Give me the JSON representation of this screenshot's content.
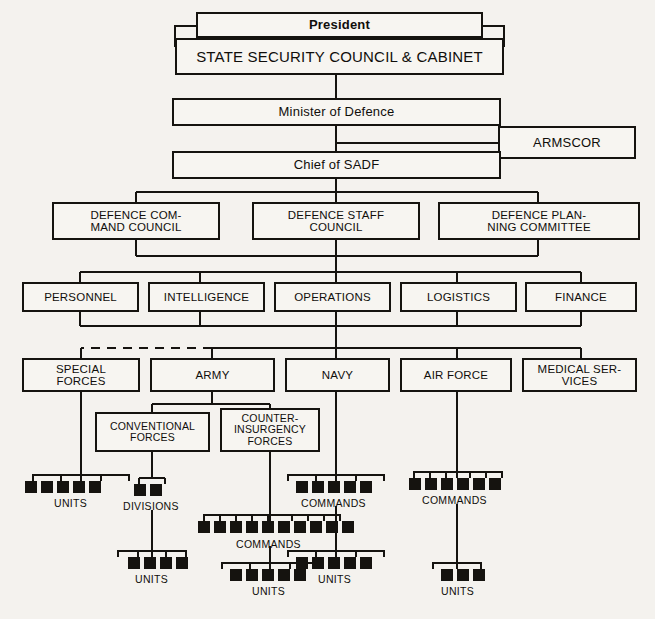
{
  "diagram": {
    "type": "org-chart",
    "line_color": "#15130f",
    "box_fill": "#f7f5f1",
    "background": "#f4f2ee"
  },
  "nodes": {
    "president": {
      "label": "President"
    },
    "state_security_council": {
      "label": "STATE SECURITY COUNCIL & CABINET"
    },
    "minister_of_defence": {
      "label": "Minister of Defence"
    },
    "armscor": {
      "label": "ARMSCOR"
    },
    "chief_of_sadf": {
      "label": "Chief of SADF"
    },
    "defence_command_council": {
      "label": "DEFENCE COM-\nMAND COUNCIL"
    },
    "defence_staff_council": {
      "label": "DEFENCE STAFF\nCOUNCIL"
    },
    "defence_planning_committee": {
      "label": "DEFENCE PLAN-\nNING COMMITTEE"
    },
    "personnel": {
      "label": "PERSONNEL"
    },
    "intelligence": {
      "label": "INTELLIGENCE"
    },
    "operations": {
      "label": "OPERATIONS"
    },
    "logistics": {
      "label": "LOGISTICS"
    },
    "finance": {
      "label": "FINANCE"
    },
    "special_forces": {
      "label": "SPECIAL\nFORCES"
    },
    "army": {
      "label": "ARMY"
    },
    "navy": {
      "label": "NAVY"
    },
    "air_force": {
      "label": "AIR FORCE"
    },
    "medical_services": {
      "label": "MEDICAL SER-\nVICES"
    },
    "conventional_forces": {
      "label": "CONVENTIONAL\nFORCES"
    },
    "counter_insurgency_forces": {
      "label": "COUNTER-\nINSURGENCY\nFORCES"
    }
  },
  "leaf_groups": {
    "sf_units": {
      "caption": "UNITS",
      "count": 5
    },
    "conv_divisions": {
      "caption": "DIVISIONS",
      "count": 2
    },
    "navy_commands": {
      "caption": "COMMANDS",
      "count": 5
    },
    "airforce_commands": {
      "caption": "COMMANDS",
      "count": 6
    },
    "coin_commands": {
      "caption": "COMMANDS",
      "count": 10
    },
    "divisions_units": {
      "caption": "UNITS",
      "count": 4
    },
    "coin_units": {
      "caption": "UNITS",
      "count": 5
    },
    "navy_units": {
      "caption": "UNITS",
      "count": 5
    },
    "airforce_units": {
      "caption": "UNITS",
      "count": 3
    }
  },
  "chart_data": {
    "type": "table",
    "levels": [
      {
        "level": 1,
        "nodes": [
          "President",
          "STATE SECURITY COUNCIL & CABINET"
        ]
      },
      {
        "level": 2,
        "nodes": [
          "Minister of Defence",
          "ARMSCOR"
        ]
      },
      {
        "level": 3,
        "nodes": [
          "Chief of SADF"
        ]
      },
      {
        "level": 4,
        "nodes": [
          "DEFENCE COMMAND COUNCIL",
          "DEFENCE STAFF COUNCIL",
          "DEFENCE PLANNING COMMITTEE"
        ]
      },
      {
        "level": 5,
        "nodes": [
          "PERSONNEL",
          "INTELLIGENCE",
          "OPERATIONS",
          "LOGISTICS",
          "FINANCE"
        ]
      },
      {
        "level": 6,
        "nodes": [
          "SPECIAL FORCES",
          "ARMY",
          "NAVY",
          "AIR FORCE",
          "MEDICAL SERVICES"
        ]
      },
      {
        "level": 7,
        "nodes": [
          "CONVENTIONAL FORCES",
          "COUNTER-INSURGENCY FORCES"
        ]
      },
      {
        "level": 8,
        "nodes": [
          "UNITS",
          "DIVISIONS",
          "COMMANDS",
          "COMMANDS"
        ]
      },
      {
        "level": 9,
        "nodes": [
          "COMMANDS",
          "UNITS",
          "UNITS",
          "UNITS",
          "UNITS"
        ]
      }
    ],
    "edges": [
      {
        "from": "STATE SECURITY COUNCIL & CABINET",
        "to": "Minister of Defence",
        "style": "solid"
      },
      {
        "from": "Minister of Defence",
        "to": "ARMSCOR",
        "style": "solid"
      },
      {
        "from": "Minister of Defence",
        "to": "Chief of SADF",
        "style": "solid"
      },
      {
        "from": "Chief of SADF",
        "to": "DEFENCE COMMAND COUNCIL",
        "style": "solid"
      },
      {
        "from": "Chief of SADF",
        "to": "DEFENCE STAFF COUNCIL",
        "style": "solid"
      },
      {
        "from": "Chief of SADF",
        "to": "DEFENCE PLANNING COMMITTEE",
        "style": "solid"
      },
      {
        "from": "councils",
        "to": "PERSONNEL",
        "style": "solid"
      },
      {
        "from": "councils",
        "to": "INTELLIGENCE",
        "style": "solid"
      },
      {
        "from": "councils",
        "to": "OPERATIONS",
        "style": "solid"
      },
      {
        "from": "councils",
        "to": "LOGISTICS",
        "style": "solid"
      },
      {
        "from": "councils",
        "to": "FINANCE",
        "style": "solid"
      },
      {
        "from": "staff-divisions",
        "to": "SPECIAL FORCES",
        "style": "dashed"
      },
      {
        "from": "staff-divisions",
        "to": "ARMY",
        "style": "solid"
      },
      {
        "from": "staff-divisions",
        "to": "NAVY",
        "style": "solid"
      },
      {
        "from": "staff-divisions",
        "to": "AIR FORCE",
        "style": "solid"
      },
      {
        "from": "staff-divisions",
        "to": "MEDICAL SERVICES",
        "style": "solid"
      },
      {
        "from": "ARMY",
        "to": "CONVENTIONAL FORCES",
        "style": "solid"
      },
      {
        "from": "ARMY",
        "to": "COUNTER-INSURGENCY FORCES",
        "style": "solid"
      },
      {
        "from": "SPECIAL FORCES",
        "to": "UNITS",
        "style": "solid"
      },
      {
        "from": "CONVENTIONAL FORCES",
        "to": "DIVISIONS",
        "style": "solid"
      },
      {
        "from": "DIVISIONS",
        "to": "UNITS",
        "style": "solid"
      },
      {
        "from": "COUNTER-INSURGENCY FORCES",
        "to": "COMMANDS",
        "style": "solid"
      },
      {
        "from": "COMMANDS",
        "to": "UNITS",
        "style": "solid"
      },
      {
        "from": "NAVY",
        "to": "COMMANDS",
        "style": "solid"
      },
      {
        "from": "COMMANDS",
        "to": "UNITS",
        "style": "solid"
      },
      {
        "from": "AIR FORCE",
        "to": "COMMANDS",
        "style": "solid"
      },
      {
        "from": "COMMANDS",
        "to": "UNITS",
        "style": "solid"
      }
    ],
    "leaf_counts": {
      "special_forces_units": 5,
      "conventional_divisions": 2,
      "divisions_units": 4,
      "coin_commands": 10,
      "coin_units": 5,
      "navy_commands": 5,
      "navy_units": 5,
      "airforce_commands": 6,
      "airforce_units": 3
    }
  }
}
